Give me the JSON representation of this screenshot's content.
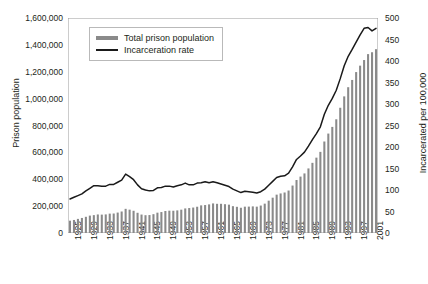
{
  "chart_data": {
    "type": "bar",
    "title": "",
    "xlabel": "",
    "ylabel": "Prison population",
    "ylabel_right": "Incarcerated per 100,000",
    "ylim": [
      0,
      1600000
    ],
    "ylim_right": [
      0,
      500
    ],
    "grid": false,
    "legend_position": "top-left",
    "y_ticks_left": [
      "0",
      "200,000",
      "400,000",
      "600,000",
      "800,000",
      "1,000,000",
      "1,200,000",
      "1,400,000",
      "1,600,000"
    ],
    "y_tick_values_left": [
      0,
      200000,
      400000,
      600000,
      800000,
      1000000,
      1200000,
      1400000,
      1600000
    ],
    "y_ticks_right": [
      "0",
      "50",
      "100",
      "150",
      "200",
      "250",
      "300",
      "350",
      "400",
      "450",
      "500"
    ],
    "y_tick_values_right": [
      0,
      50,
      100,
      150,
      200,
      250,
      300,
      350,
      400,
      450,
      500
    ],
    "x_tick_labels": [
      "1925",
      "1929",
      "1933",
      "1937",
      "1941",
      "1945",
      "1949",
      "1953",
      "1957",
      "1961",
      "1965",
      "1969",
      "1973",
      "1977",
      "1981",
      "1985",
      "1989",
      "1993",
      "1997",
      "2001"
    ],
    "x_tick_values": [
      1925,
      1929,
      1933,
      1937,
      1941,
      1945,
      1949,
      1953,
      1957,
      1961,
      1965,
      1969,
      1973,
      1977,
      1981,
      1985,
      1989,
      1993,
      1997,
      2001
    ],
    "x": [
      1925,
      1926,
      1927,
      1928,
      1929,
      1930,
      1931,
      1932,
      1933,
      1934,
      1935,
      1936,
      1937,
      1938,
      1939,
      1940,
      1941,
      1942,
      1943,
      1944,
      1945,
      1946,
      1947,
      1948,
      1949,
      1950,
      1951,
      1952,
      1953,
      1954,
      1955,
      1956,
      1957,
      1958,
      1959,
      1960,
      1961,
      1962,
      1963,
      1964,
      1965,
      1966,
      1967,
      1968,
      1969,
      1970,
      1971,
      1972,
      1973,
      1974,
      1975,
      1976,
      1977,
      1978,
      1979,
      1980,
      1981,
      1982,
      1983,
      1984,
      1985,
      1986,
      1987,
      1988,
      1989,
      1990,
      1991,
      1992,
      1993,
      1994,
      1995,
      1996,
      1997,
      1998,
      1999,
      2000,
      2001,
      2002
    ],
    "series": [
      {
        "name": "Total prison population",
        "axis": "left",
        "kind": "bar",
        "color": "#8a8a8a",
        "values": [
          91669,
          97000,
          104983,
          112000,
          120496,
          129453,
          133000,
          137997,
          136810,
          138316,
          144180,
          145038,
          152000,
          160000,
          179818,
          173706,
          165439,
          150384,
          137220,
          132456,
          133649,
          140079,
          151304,
          155977,
          163749,
          166123,
          165680,
          168233,
          173579,
          182901,
          185780,
          189565,
          195414,
          205643,
          208105,
          212953,
          220149,
          217283,
          217283,
          214336,
          210895,
          199654,
          194896,
          187914,
          196007,
          196429,
          198061,
          196092,
          204211,
          218466,
          240593,
          262833,
          285456,
          294396,
          301470,
          315974,
          353167,
          394374,
          419820,
          443398,
          480568,
          522084,
          560812,
          603732,
          680907,
          739980,
          789610,
          846277,
          932074,
          1016691,
          1085022,
          1138984,
          1197590,
          1245402,
          1287172,
          1331278,
          1345217,
          1367856
        ],
        "ylim": [
          0,
          1600000
        ]
      },
      {
        "name": "Incarceration rate",
        "axis": "right",
        "kind": "line",
        "color": "#1a1a1a",
        "unit": "per 100,000",
        "values": [
          79,
          83,
          87,
          91,
          98,
          104,
          110,
          110,
          109,
          109,
          113,
          113,
          118,
          123,
          137,
          131,
          124,
          112,
          103,
          100,
          98,
          99,
          105,
          106,
          109,
          109,
          107,
          110,
          112,
          116,
          112,
          112,
          116,
          117,
          119,
          117,
          119,
          117,
          114,
          111,
          108,
          102,
          98,
          94,
          97,
          96,
          95,
          93,
          96,
          102,
          111,
          120,
          129,
          132,
          133,
          139,
          154,
          171,
          179,
          188,
          202,
          217,
          231,
          247,
          276,
          297,
          313,
          332,
          359,
          389,
          411,
          427,
          444,
          461,
          476,
          478,
          470,
          476
        ],
        "ylim": [
          0,
          500
        ]
      }
    ]
  },
  "legend": {
    "items": [
      {
        "label": "Total prison population",
        "swatch": "bars"
      },
      {
        "label": "Incarceration rate",
        "swatch": "rate"
      }
    ]
  },
  "colors": {
    "bar": "#8a8a8a",
    "line": "#1a1a1a",
    "axis": "#9a9a9a",
    "text": "#231f20",
    "legend_border": "#b9b9b9",
    "background": "#ffffff"
  }
}
